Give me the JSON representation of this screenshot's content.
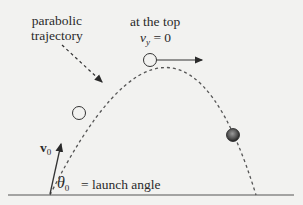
{
  "labels": {
    "trajectory_line1": "parabolic",
    "trajectory_line2": "trajectory",
    "top_label": "at the top",
    "vy_symbol": "v",
    "vy_subscript": "y",
    "vy_value": " = 0",
    "v0_symbol": "v",
    "v0_subscript": "0",
    "theta_symbol": "θ",
    "theta_subscript": "0",
    "theta_desc": "= launch angle"
  },
  "colors": {
    "background": "#f2f2f0",
    "ink": "#2a2a2a",
    "ball": "#444444"
  }
}
